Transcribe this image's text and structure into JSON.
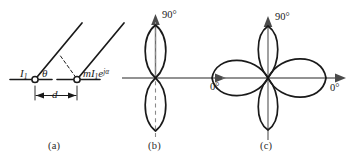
{
  "figure": {
    "type": "antenna-array-radiation-pattern-diagram",
    "background": "#ffffff",
    "line_color": "#1a1a1a",
    "panels": [
      {
        "id": "a",
        "caption": "(a)",
        "description": "two-element array geometry",
        "labels": {
          "source_left": "I",
          "source_left_sub": "1",
          "angle": "θ",
          "spacing": "d",
          "source_right_mag": "mI",
          "source_right_sub": "1",
          "source_right_exp_base": "e",
          "source_right_exp": "jα"
        }
      },
      {
        "id": "b",
        "caption": "(b)",
        "description": "vertical figure-eight polar pattern, two lobes",
        "labels": {
          "axis_vertical": "90",
          "axis_vertical_unit": "°",
          "axis_horizontal": "0",
          "axis_horizontal_unit": "°"
        }
      },
      {
        "id": "c",
        "caption": "(c)",
        "description": "four-lobe clover polar pattern",
        "labels": {
          "axis_vertical": "90",
          "axis_vertical_unit": "°",
          "axis_horizontal": "0",
          "axis_horizontal_unit": "°"
        }
      }
    ]
  }
}
